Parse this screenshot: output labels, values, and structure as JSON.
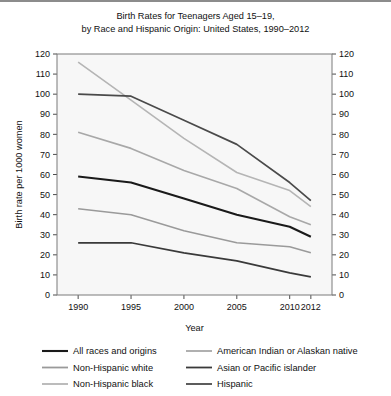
{
  "chart_data": {
    "type": "line",
    "title": "Birth Rates for Teenagers Aged 15–19, by Race and Hispanic Origin: United States, 1990–2012",
    "title_lines": [
      "Birth Rates for Teenagers Aged 15–19,",
      "by Race and Hispanic Origin: United States, 1990–2012"
    ],
    "xlabel": "Year",
    "ylabel": "Birth rate per 1000 women",
    "x": [
      1990,
      1995,
      2000,
      2005,
      2010,
      2012
    ],
    "xtick_labels": [
      "1990",
      "1995",
      "2000",
      "2005",
      "2010",
      "2012"
    ],
    "xlim": [
      1988,
      2014
    ],
    "ylim": [
      0,
      120
    ],
    "ytick_values": [
      0,
      10,
      20,
      30,
      40,
      50,
      60,
      70,
      80,
      90,
      100,
      110,
      120
    ],
    "ytick_labels": [
      "0",
      "10",
      "20",
      "30",
      "40",
      "50",
      "60",
      "70",
      "80",
      "90",
      "100",
      "110",
      "120"
    ],
    "grid": false,
    "right_axis_mirrored": true,
    "legend_position": "below",
    "series": [
      {
        "name": "All races and origins",
        "color": "#1a1a1a",
        "width": 2.1,
        "values": [
          59,
          56,
          48,
          40,
          34,
          29
        ]
      },
      {
        "name": "Non-Hispanic white",
        "color": "#9a9a9a",
        "width": 1.5,
        "values": [
          43,
          40,
          32,
          26,
          24,
          21
        ]
      },
      {
        "name": "Non-Hispanic black",
        "color": "#b5b5b5",
        "width": 1.6,
        "values": [
          116,
          97,
          78,
          61,
          52,
          44
        ]
      },
      {
        "name": "American Indian or Alaskan native",
        "color": "#a8a8a8",
        "width": 1.6,
        "values": [
          81,
          73,
          62,
          53,
          39,
          35
        ]
      },
      {
        "name": "Asian or Pacific islander",
        "color": "#3a3a3a",
        "width": 1.7,
        "values": [
          26,
          26,
          21,
          17,
          11,
          9
        ]
      },
      {
        "name": "Hispanic",
        "color": "#4a4a4a",
        "width": 1.7,
        "values": [
          100,
          99,
          87,
          75,
          56,
          47
        ]
      }
    ],
    "legend_columns": [
      [
        "All races and origins",
        "Non-Hispanic white",
        "Non-Hispanic black"
      ],
      [
        "American Indian or Alaskan native",
        "Asian or Pacific islander",
        "Hispanic"
      ]
    ]
  }
}
